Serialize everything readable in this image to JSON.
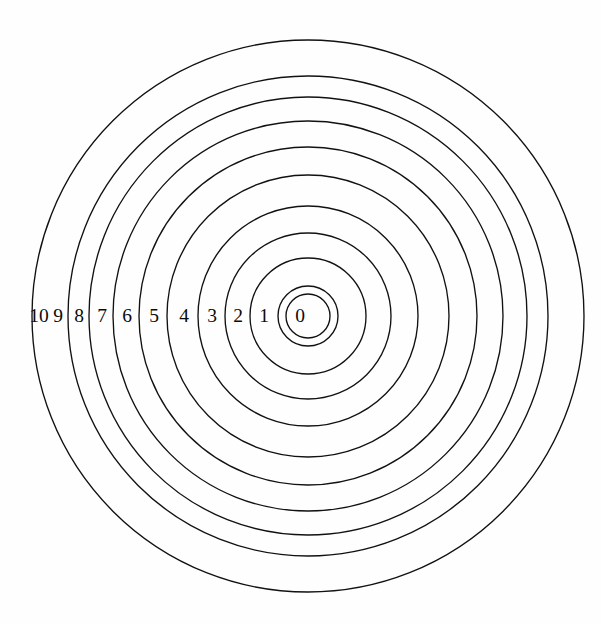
{
  "figure": {
    "background_color": "#fefefe",
    "stroke_color": "#111111",
    "label_color": "#0b0b0b",
    "width": 601,
    "height": 623
  },
  "chart_data": {
    "type": "scatter",
    "subtitle": "",
    "xlabel": "",
    "ylabel": "",
    "grid": false,
    "legend": "none",
    "center": {
      "x": 308,
      "y": 316
    },
    "label_axis": "horizontal-left-of-center",
    "ring_count": 11,
    "categories": [
      "0",
      "1",
      "2",
      "3",
      "4",
      "5",
      "6",
      "7",
      "8",
      "9",
      "10"
    ],
    "values": [
      22,
      30,
      58,
      83,
      110,
      141,
      169,
      195,
      219,
      240,
      276
    ],
    "series": [
      {
        "name": "ring radius (px)",
        "values": [
          22,
          30,
          58,
          83,
          110,
          141,
          169,
          195,
          219,
          240,
          276
        ]
      }
    ],
    "rings": [
      {
        "label": "0",
        "radius": 22,
        "label_x": 300,
        "label_y": 318
      },
      {
        "label": "1",
        "radius": 30,
        "label_y": 318,
        "label_x": 264
      },
      {
        "label": "2",
        "radius": 58,
        "label_y": 318,
        "label_x": 238
      },
      {
        "label": "3",
        "radius": 83,
        "label_y": 318,
        "label_x": 212
      },
      {
        "label": "4",
        "radius": 110,
        "label_y": 318,
        "label_x": 184
      },
      {
        "label": "5",
        "radius": 141,
        "label_y": 318,
        "label_x": 154
      },
      {
        "label": "6",
        "radius": 169,
        "label_y": 318,
        "label_x": 127
      },
      {
        "label": "7",
        "radius": 195,
        "label_y": 318,
        "label_x": 102
      },
      {
        "label": "8",
        "radius": 219,
        "label_y": 318,
        "label_x": 79
      },
      {
        "label": "9",
        "radius": 240,
        "label_y": 318,
        "label_x": 58
      },
      {
        "label": "10",
        "radius": 276,
        "label_y": 318,
        "label_x": 39
      }
    ],
    "annotations": []
  }
}
